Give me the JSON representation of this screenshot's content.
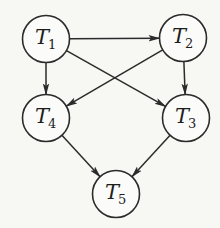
{
  "diagram": {
    "type": "directed-acyclic-graph",
    "stroke_color": "#2b2b2b",
    "background_color": "#f7f7f4",
    "nodes": [
      {
        "id": "T1",
        "letter": "T",
        "sub": "1",
        "cx": 46,
        "cy": 39,
        "r": 23.5
      },
      {
        "id": "T2",
        "letter": "T",
        "sub": "2",
        "cx": 183,
        "cy": 38,
        "r": 23.5
      },
      {
        "id": "T4",
        "letter": "T",
        "sub": "4",
        "cx": 46,
        "cy": 118,
        "r": 23.5
      },
      {
        "id": "T3",
        "letter": "T",
        "sub": "3",
        "cx": 186,
        "cy": 118,
        "r": 23.5
      },
      {
        "id": "T5",
        "letter": "T",
        "sub": "5",
        "cx": 116,
        "cy": 194,
        "r": 23.5
      }
    ],
    "edges": [
      {
        "from": "T1",
        "to": "T2"
      },
      {
        "from": "T1",
        "to": "T4"
      },
      {
        "from": "T1",
        "to": "T3"
      },
      {
        "from": "T2",
        "to": "T4"
      },
      {
        "from": "T2",
        "to": "T3"
      },
      {
        "from": "T4",
        "to": "T5"
      },
      {
        "from": "T3",
        "to": "T5"
      }
    ]
  }
}
